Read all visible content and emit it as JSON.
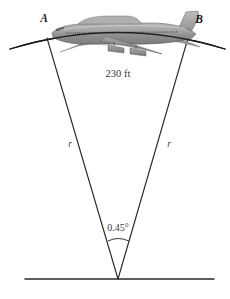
{
  "figure": {
    "type": "geometry-diagram",
    "background_color": "#ffffff",
    "line_color": "#1a1a1a",
    "text_color": "#3a3a3a"
  },
  "labels": {
    "point_a": "A",
    "point_b": "B",
    "arc_length": "230 ft",
    "radius_left": "r",
    "radius_right": "r",
    "central_angle": "0.45°"
  },
  "geometry": {
    "vertex": {
      "x": 118,
      "y": 279
    },
    "point_a": {
      "x": 47,
      "y": 38
    },
    "point_b": {
      "x": 188,
      "y": 38
    },
    "arc_left_end": {
      "x": 10,
      "y": 49
    },
    "arc_right_end": {
      "x": 225,
      "y": 49
    },
    "arc_apex": {
      "x": 118,
      "y": 26
    },
    "ground_line": {
      "x1": 25,
      "x2": 214,
      "y": 279
    },
    "angle_arc": {
      "x1": 108,
      "x2": 129,
      "y": 240
    }
  },
  "airplane": {
    "name": "jet-airliner-side-view",
    "body_fill": "#9e9e9e",
    "wing_fill": "#8a8a8a",
    "tail_fill": "#a8a8a8",
    "outline": "#4a4a4a",
    "nose_x": 52,
    "tail_x": 196,
    "center_y": 33
  },
  "label_positions": {
    "point_a": {
      "x": 44,
      "y": 20
    },
    "point_b": {
      "x": 198,
      "y": 22
    },
    "arc_length": {
      "x": 118,
      "y": 76
    },
    "radius_left": {
      "x": 70,
      "y": 146
    },
    "radius_right": {
      "x": 169,
      "y": 146
    },
    "central_angle": {
      "x": 118,
      "y": 229
    }
  }
}
